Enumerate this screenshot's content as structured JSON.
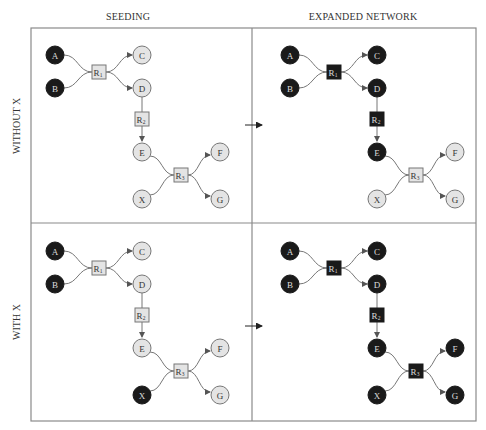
{
  "columns": [
    {
      "id": "seeding",
      "label": "SEEDING"
    },
    {
      "id": "expanded",
      "label": "EXPANDED NETWORK"
    }
  ],
  "rows": [
    {
      "id": "without_x",
      "label": "WITHOUT X"
    },
    {
      "id": "with_x",
      "label": "WITH X"
    }
  ],
  "colors": {
    "active_fill": "#1a1a1a",
    "active_text": "#dddddd",
    "inactive_fill": "#e4e4e4",
    "inactive_stroke": "#777777",
    "inactive_text": "#333333",
    "frame": "#8a8a8a"
  },
  "node_labels": {
    "A": "A",
    "B": "B",
    "C": "C",
    "D": "D",
    "E": "E",
    "F": "F",
    "G": "G",
    "X": "X"
  },
  "reactions": {
    "R1": {
      "base": "R",
      "sub": "1"
    },
    "R2": {
      "base": "R",
      "sub": "2"
    },
    "R3": {
      "base": "R",
      "sub": "3"
    }
  },
  "panels": [
    {
      "row": "without_x",
      "col": "seeding",
      "active": [
        "A",
        "B"
      ]
    },
    {
      "row": "without_x",
      "col": "expanded",
      "active": [
        "A",
        "B",
        "C",
        "D",
        "E",
        "R1",
        "R2"
      ]
    },
    {
      "row": "with_x",
      "col": "seeding",
      "active": [
        "A",
        "B",
        "X"
      ]
    },
    {
      "row": "with_x",
      "col": "expanded",
      "active": [
        "A",
        "B",
        "C",
        "D",
        "E",
        "F",
        "G",
        "X",
        "R1",
        "R2",
        "R3"
      ]
    }
  ],
  "arrow_label": "→"
}
